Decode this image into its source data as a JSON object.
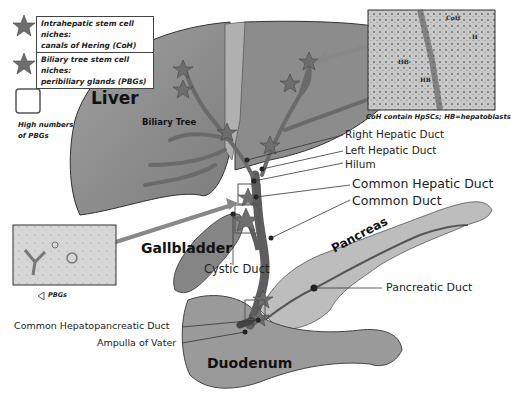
{
  "legend": {
    "items": [
      {
        "icon": "star-icon",
        "line1": "Intrahepatic stem cell niches:",
        "line2": "canals of Hering (CoH)"
      },
      {
        "icon": "star-icon",
        "line1": "Biliary tree stem cell niches:",
        "line2": "peribiliary glands (PBGs)"
      },
      {
        "icon": "square-outline-icon",
        "line1": "High numbers",
        "line2": "of PBGs"
      }
    ]
  },
  "organs": {
    "liver": "Liver",
    "biliary_tree": "Biliary Tree",
    "gallbladder": "Gallbladder",
    "pancreas": "Pancreas",
    "duodenum": "Duodenum"
  },
  "duct_labels": {
    "right_hepatic": "Right Hepatic Duct",
    "left_hepatic": "Left Hepatic Duct",
    "hilum": "Hilum",
    "common_hepatic": "Common Hepatic Duct",
    "common": "Common Duct",
    "cystic": "Cystic Duct",
    "pancreatic": "Pancreatic Duct",
    "common_hepatopancreatic": "Common Hepatopancreatic Duct",
    "ampulla": "Ampulla of Vater"
  },
  "insets": {
    "histology_coh": {
      "caption": "CoH contain HpSCs; HB=hepatoblasts",
      "labels": [
        "CoH",
        "HB",
        "HB",
        "H"
      ]
    },
    "histology_pbg": {
      "caption": "PBGs"
    }
  },
  "colors": {
    "liver_fill": "#8a8a8a",
    "liver_light": "#a9a9a9",
    "duct_fill": "#707070",
    "pancreas_fill": "#bdbdbd",
    "duodenum_fill": "#9a9a9a",
    "star_fill": "#6e6e6e",
    "label_text": "#222222"
  }
}
